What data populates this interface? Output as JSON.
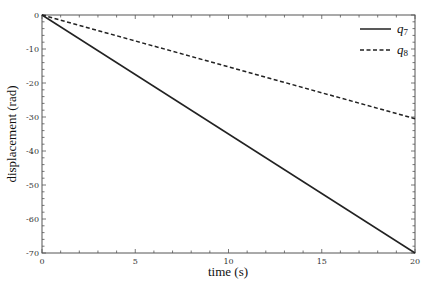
{
  "chart_data": {
    "type": "line",
    "title": "",
    "xlabel": "time (s)",
    "ylabel": "displacement (rad)",
    "xlim": [
      0,
      20
    ],
    "ylim": [
      -70,
      0
    ],
    "xticks": [
      0,
      5,
      10,
      15,
      20
    ],
    "yticks": [
      0,
      -10,
      -20,
      -30,
      -40,
      -50,
      -60,
      -70
    ],
    "grid": false,
    "legend_position": "upper right",
    "series": [
      {
        "name": "q7",
        "label_base": "q",
        "label_sub": "7",
        "style": "solid",
        "x": [
          0,
          20
        ],
        "y": [
          0,
          -70
        ]
      },
      {
        "name": "q8",
        "label_base": "q",
        "label_sub": "8",
        "style": "dashed",
        "x": [
          0,
          20
        ],
        "y": [
          0,
          -30.5
        ]
      }
    ]
  }
}
